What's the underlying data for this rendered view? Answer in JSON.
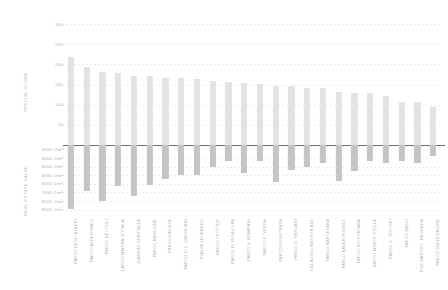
{
  "chart_data": {
    "type": "bar",
    "title": "",
    "subtitle": "",
    "orientation": "vertical",
    "grid": true,
    "legend_position": "none",
    "axis_titles": {
      "upper": "SPECIAL SCORE",
      "lower": "REAL ESTATE VALUE"
    },
    "upper_axis": {
      "label": "SPECIAL SCORE",
      "ticks": [
        300,
        250,
        200,
        150,
        100,
        50
      ],
      "tick_labels": [
        "300",
        "250",
        "200",
        "150",
        "100",
        "50"
      ],
      "ylim": [
        0,
        300
      ]
    },
    "lower_axis": {
      "label": "REAL ESTATE VALUE",
      "unit": "€/m²",
      "ticks": [
        2000,
        3000,
        4000,
        5000,
        6000,
        7000,
        8000,
        9000
      ],
      "tick_labels": [
        "2000 €/m²",
        "3000 €/m²",
        "4000 €/m²",
        "5000 €/m²",
        "6000 €/m²",
        "7000 €/m²",
        "8000 €/m²",
        "9000 €/m²"
      ],
      "ylim": [
        1500,
        9500
      ]
    },
    "categories": [
      "PARCO DEGLI ALBERI",
      "PARCO ALFA ROMEO",
      "PARCO DEI TIGLI",
      "LARGO MARINAI D'ITALIA",
      "GIARDINI GUASTALLA",
      "PARCO BASILICHE",
      "PARCO RAVIZZA",
      "PARCO D. L. CAVIGLIANI",
      "PIAZZA LEONARDO",
      "PARCO TROTTER",
      "PARCO DI VILLA LUPA",
      "PARCO V. BOMPIANI",
      "PARCO R. VERGA",
      "PARCO RESISTENZA",
      "PARCO G. VERGANI",
      "VILLAGGIO INDUSTRIALE",
      "PARCO MARTESANA",
      "PARCO BADEN POWELL",
      "PARCO SUI FONTANA",
      "PARCO MONTE STELLA",
      "PARCO G. TESTORI",
      "PARCO BASSI",
      "P.LE MARTIRI - PAGLIERA",
      "PARCO DELLE FAGGIE"
    ],
    "series": [
      {
        "name": "SPECIAL SCORE",
        "direction": "up",
        "color": "#e3e3e3",
        "values": [
          218,
          193,
          180,
          179,
          172,
          170,
          167,
          167,
          163,
          158,
          156,
          153,
          152,
          147,
          146,
          141,
          142,
          131,
          130,
          130,
          121,
          107,
          107,
          94
        ]
      },
      {
        "name": "REAL ESTATE VALUE",
        "direction": "down",
        "color": "#c4c4c4",
        "unit": "€/m²",
        "values": [
          8900,
          6800,
          8000,
          6200,
          7400,
          6100,
          5400,
          5000,
          5000,
          4000,
          3400,
          4800,
          3400,
          5800,
          4400,
          4100,
          3600,
          5700,
          4500,
          3400,
          3600,
          3400,
          3600,
          2800
        ]
      }
    ]
  },
  "caption": {
    "text": ""
  }
}
